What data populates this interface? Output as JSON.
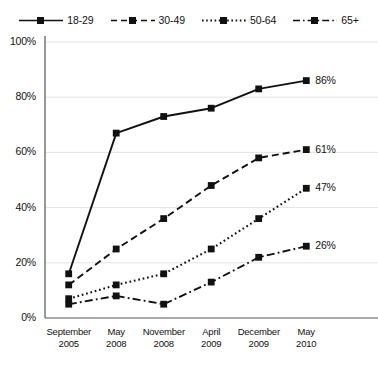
{
  "chart_data": {
    "type": "line",
    "title": "",
    "xlabel": "",
    "ylabel": "",
    "ylim": [
      0,
      100
    ],
    "y_ticks": [
      "0%",
      "20%",
      "40%",
      "60%",
      "80%",
      "100%"
    ],
    "y_tick_values": [
      0,
      20,
      40,
      60,
      80,
      100
    ],
    "grid": true,
    "legend_position": "top",
    "categories": [
      "September 2005",
      "May 2008",
      "November 2008",
      "April 2009",
      "December 2009",
      "May 2010"
    ],
    "category_lines": [
      [
        "September",
        "2005"
      ],
      [
        "May",
        "2008"
      ],
      [
        "November",
        "2008"
      ],
      [
        "April",
        "2009"
      ],
      [
        "December",
        "2009"
      ],
      [
        "May",
        "2010"
      ]
    ],
    "series": [
      {
        "name": "18-29",
        "style": "solid",
        "values": [
          16,
          67,
          73,
          76,
          83,
          86
        ],
        "end_label": "86%"
      },
      {
        "name": "30-49",
        "style": "dashed",
        "values": [
          12,
          25,
          36,
          48,
          58,
          61
        ],
        "end_label": "61%"
      },
      {
        "name": "50-64",
        "style": "dotted",
        "values": [
          7,
          12,
          16,
          25,
          36,
          47
        ],
        "end_label": "47%"
      },
      {
        "name": "65+",
        "style": "dash-dot",
        "values": [
          5,
          8,
          5,
          13,
          22,
          26
        ],
        "end_label": "26%"
      }
    ],
    "colors": {
      "line": "#111111",
      "marker": "#111111",
      "grid": "#e3e3e3",
      "axis": "#555555",
      "background": "#ffffff"
    }
  },
  "legend": {
    "items": [
      {
        "label": "18-29",
        "style": "solid"
      },
      {
        "label": "30-49",
        "style": "dashed"
      },
      {
        "label": "50-64",
        "style": "dotted"
      },
      {
        "label": "65+",
        "style": "dash-dot"
      }
    ]
  }
}
